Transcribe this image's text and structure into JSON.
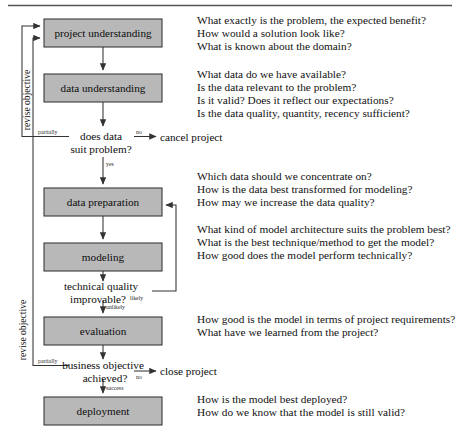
{
  "figure": {
    "title_rule": true
  },
  "flow": {
    "process_boxes": [
      {
        "id": "project-understanding",
        "label": "project understanding",
        "x": 44,
        "y": 19,
        "w": 118,
        "h": 28
      },
      {
        "id": "data-understanding",
        "label": "data understanding",
        "x": 44,
        "y": 74,
        "w": 118,
        "h": 28
      },
      {
        "id": "data-preparation",
        "label": "data preparation",
        "x": 44,
        "y": 188,
        "w": 118,
        "h": 28
      },
      {
        "id": "modeling",
        "label": "modeling",
        "x": 44,
        "y": 243,
        "w": 118,
        "h": 28
      },
      {
        "id": "evaluation",
        "label": "evaluation",
        "x": 44,
        "y": 317,
        "w": 118,
        "h": 28
      },
      {
        "id": "deployment",
        "label": "deployment",
        "x": 44,
        "y": 397,
        "w": 118,
        "h": 28
      }
    ],
    "decisions": [
      {
        "id": "does-data-suit-problem",
        "line1": "does data",
        "line2": "suit problem?"
      },
      {
        "id": "technical-quality-improvable",
        "line1": "technical quality",
        "line2": "improvable?"
      },
      {
        "id": "business-objective-achieved",
        "line1": "business objective",
        "line2": "achieved?"
      }
    ],
    "terminals": [
      {
        "id": "cancel-project",
        "label": "cancel project"
      },
      {
        "id": "close-project",
        "label": "close project"
      }
    ],
    "edge_labels": {
      "partially_top": "partially",
      "no_cancel": "no",
      "yes": "yes",
      "likely": "likely",
      "unlikely": "unlikely",
      "partially_bottom": "partially",
      "no_close": "no",
      "success": "success"
    },
    "loop_labels": {
      "revise_objective_top": "revise objective",
      "revise_objective_bottom": "revise objective"
    },
    "colors": {
      "box_fill": "#b8b8b8",
      "box_stroke": "#3a3a3a",
      "line": "#333333",
      "text": "#0d0d0d"
    }
  },
  "annotations": [
    {
      "id": "project-understanding-questions",
      "x": 197,
      "y": 14,
      "lines": [
        "What exactly is the problem, the expected benefit?",
        "How would a solution look like?",
        "What is known about the domain?"
      ]
    },
    {
      "id": "data-understanding-questions",
      "x": 197,
      "y": 68,
      "lines": [
        "What data do we have available?",
        "Is the data relevant to the problem?",
        "Is it valid? Does it reflect our expectations?",
        "Is the data quality, quantity, recency sufficient?"
      ]
    },
    {
      "id": "data-preparation-questions",
      "x": 197,
      "y": 170,
      "lines": [
        "Which data should we concentrate on?",
        "How is the data best transformed for modeling?",
        "How may we increase the data quality?"
      ]
    },
    {
      "id": "modeling-questions",
      "x": 197,
      "y": 223,
      "lines": [
        "What kind of model architecture suits the problem best?",
        "What is the best technique/method to get the model?",
        "How good does the model perform technically?"
      ]
    },
    {
      "id": "evaluation-questions",
      "x": 197,
      "y": 313,
      "lines": [
        "How good is the model in terms of project requirements?",
        "What have we learned from the project?"
      ]
    },
    {
      "id": "deployment-questions",
      "x": 197,
      "y": 393,
      "lines": [
        "How is the model best deployed?",
        "How do we know that the model is still valid?"
      ]
    }
  ]
}
